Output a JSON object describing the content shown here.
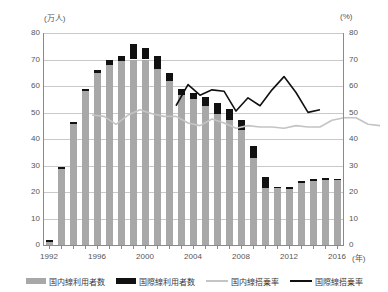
{
  "axes": {
    "left_unit": "(万人)",
    "right_unit": "(%)",
    "x_unit": "(年)",
    "yticks_left": [
      "80",
      "70",
      "60",
      "50",
      "40",
      "30",
      "20",
      "10",
      "0"
    ],
    "yticks_right": [
      "80",
      "70",
      "60",
      "50",
      "40",
      "30",
      "20",
      "10",
      "0"
    ],
    "xticks": [
      "1992",
      "1996",
      "2000",
      "2004",
      "2008",
      "2012",
      "2016"
    ]
  },
  "legend": {
    "items": [
      {
        "label": "国内線利用者数",
        "type": "bar",
        "color": "#a8a8a8"
      },
      {
        "label": "国際線利用者数",
        "type": "bar",
        "color": "#111111"
      },
      {
        "label": "国内線搭乗率",
        "type": "line",
        "color": "#c4c4c4"
      },
      {
        "label": "国際線搭乗率",
        "type": "line",
        "color": "#111111"
      }
    ]
  },
  "chart_data": {
    "type": "bar",
    "title": "",
    "subtitle": "",
    "xlabel": "(年)",
    "ylabel": "(万人)",
    "y2label": "(%)",
    "ylim": [
      0,
      80
    ],
    "y2lim": [
      0,
      80
    ],
    "grid": true,
    "legend_position": "bottom",
    "stacked": true,
    "categories": [
      "1992",
      "1993",
      "1994",
      "1995",
      "1996",
      "1997",
      "1998",
      "1999",
      "2000",
      "2001",
      "2002",
      "2003",
      "2004",
      "2005",
      "2006",
      "2007",
      "2008",
      "2009",
      "2010",
      "2011",
      "2012",
      "2013",
      "2014",
      "2015",
      "2016"
    ],
    "series": [
      {
        "name": "国内線利用者数",
        "type": "bar",
        "axis": "left",
        "color": "#a8a8a8",
        "values": [
          1.0,
          28.5,
          45.5,
          58.0,
          65.0,
          68.0,
          69.5,
          70.0,
          70.0,
          66.5,
          62.0,
          56.5,
          55.0,
          52.5,
          49.5,
          47.0,
          43.5,
          33.0,
          21.5,
          21.5,
          21.0,
          23.5,
          24.0,
          24.5,
          24.5
        ]
      },
      {
        "name": "国際線利用者数",
        "type": "bar",
        "axis": "left",
        "color": "#111111",
        "values": [
          1.0,
          1.0,
          1.0,
          1.0,
          1.0,
          2.0,
          2.0,
          6.0,
          4.5,
          5.0,
          3.0,
          2.5,
          2.5,
          3.5,
          4.0,
          4.5,
          3.5,
          4.5,
          4.0,
          0.5,
          0.8,
          0.8,
          0.8,
          0.8,
          0.5
        ]
      },
      {
        "name": "国内線搭乗率",
        "type": "line",
        "axis": "right",
        "color": "#c4c4c4",
        "values": [
          61.5,
          61.0,
          58.0,
          61.5,
          63.5,
          62.0,
          61.0,
          61.0,
          58.5,
          57.5,
          60.0,
          58.5,
          56.5,
          57.5,
          57.0,
          57.0,
          56.5,
          57.5,
          57.0,
          57.0,
          59.5,
          60.5,
          60.5,
          58.0,
          57.5
        ]
      },
      {
        "name": "国際線搭乗率",
        "type": "line",
        "axis": "right",
        "color": "#111111",
        "values": [
          null,
          null,
          null,
          null,
          null,
          null,
          null,
          65.0,
          73.0,
          69.0,
          71.0,
          70.5,
          63.0,
          68.0,
          65.0,
          71.0,
          76.0,
          70.0,
          62.5,
          63.5,
          null,
          null,
          null,
          null,
          null
        ]
      }
    ]
  }
}
